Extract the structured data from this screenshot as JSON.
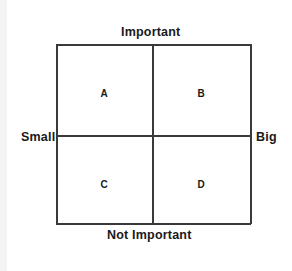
{
  "diagram": {
    "type": "2x2 matrix",
    "axes": {
      "top": "Important",
      "bottom": "Not Important",
      "left": "Small",
      "right": "Big"
    },
    "quadrants": [
      {
        "id": "top-left",
        "label": "A"
      },
      {
        "id": "top-right",
        "label": "B"
      },
      {
        "id": "bottom-left",
        "label": "C"
      },
      {
        "id": "bottom-right",
        "label": "D"
      }
    ]
  }
}
